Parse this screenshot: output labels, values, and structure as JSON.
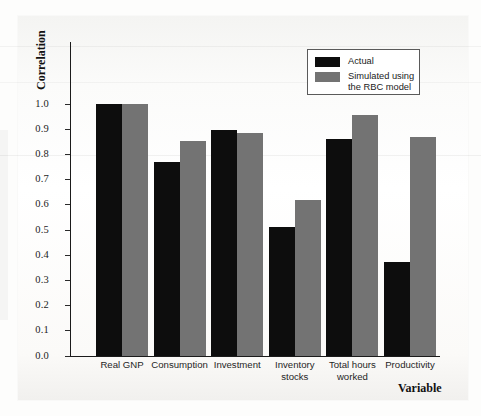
{
  "chart_data": {
    "type": "bar",
    "title": "",
    "xlabel": "Variable",
    "ylabel": "Correlation",
    "categories": [
      "Real GNP",
      "Consumption",
      "Investment",
      "Inventory\nstocks",
      "Total hours\nworked",
      "Productivity"
    ],
    "ylim": [
      0.0,
      1.0
    ],
    "ytick_labels": [
      "1.0",
      "0.9",
      "0.8",
      "0.7",
      "0.6",
      "0.5",
      "0.4",
      "0.3",
      "0.2",
      "0.1",
      "0.0"
    ],
    "ytick_values": [
      1.0,
      0.9,
      0.8,
      0.7,
      0.6,
      0.5,
      0.4,
      0.3,
      0.2,
      0.1,
      0.0
    ],
    "grid": false,
    "legend_position": "top-right",
    "series": [
      {
        "name": "Actual",
        "color": "#0d0d0d",
        "values": [
          1.0,
          0.77,
          0.895,
          0.51,
          0.86,
          0.375
        ]
      },
      {
        "name": "Simulated using\nthe RBC model",
        "color": "#737373",
        "values": [
          1.0,
          0.855,
          0.885,
          0.62,
          0.955,
          0.87
        ]
      }
    ]
  },
  "legend": {
    "entries": [
      {
        "label": "Actual",
        "swatch": "#0d0d0d"
      },
      {
        "label": "Simulated using\nthe RBC model",
        "swatch": "#737373"
      }
    ]
  },
  "axis": {
    "y_title": "Correlation",
    "x_title": "Variable"
  }
}
